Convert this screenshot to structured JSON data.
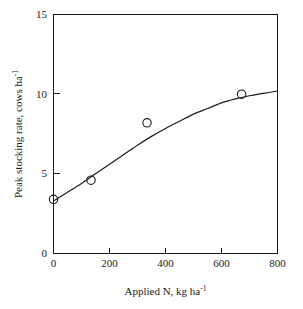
{
  "chart_data": {
    "type": "scatter",
    "title": "",
    "subtitle": "",
    "xlabel_parts": {
      "main": "Applied N, kg ha",
      "sup": "-1"
    },
    "ylabel_parts": {
      "main": "Peak stocking rate, cows ha",
      "sup": "-1"
    },
    "xlabel": "Applied N, kg ha-1",
    "ylabel": "Peak stocking rate, cows ha-1",
    "xlim": [
      0,
      800
    ],
    "ylim": [
      0,
      15
    ],
    "xticks": [
      0,
      200,
      400,
      600,
      800
    ],
    "yticks": [
      0,
      5,
      10,
      15
    ],
    "xtick_labels": [
      "0",
      "200",
      "400",
      "600",
      "800"
    ],
    "ytick_labels": [
      "0",
      "5",
      "10",
      "15"
    ],
    "grid": false,
    "legend": null,
    "marker_style": "open-circle",
    "series": [
      {
        "name": "Peak stocking rate",
        "x": [
          0,
          134,
          334,
          672
        ],
        "values": [
          3.4,
          4.6,
          8.2,
          10.0
        ]
      }
    ],
    "fit_curve": {
      "name": "fitted response curve",
      "x": [
        0,
        50,
        100,
        150,
        200,
        250,
        300,
        350,
        400,
        450,
        500,
        550,
        600,
        650,
        700,
        750,
        800
      ],
      "y": [
        3.3,
        3.85,
        4.4,
        5.0,
        5.6,
        6.2,
        6.8,
        7.35,
        7.85,
        8.3,
        8.75,
        9.1,
        9.45,
        9.7,
        9.9,
        10.05,
        10.2
      ]
    },
    "colors": {
      "axis": "#1a1a1a",
      "curve": "#1a1a1a",
      "marker": "#1a1a1a",
      "background": "#ffffff"
    }
  }
}
